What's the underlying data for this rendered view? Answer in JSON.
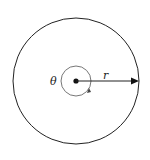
{
  "diagram": {
    "labels": {
      "angle": "θ",
      "radius": "r"
    },
    "outer_circle": {
      "cx": 76,
      "cy": 81,
      "r": 63
    },
    "inner_circle": {
      "cx": 76,
      "cy": 81,
      "r": 15
    },
    "colors": {
      "stroke": "#222222",
      "inner_stroke": "#777777"
    }
  }
}
